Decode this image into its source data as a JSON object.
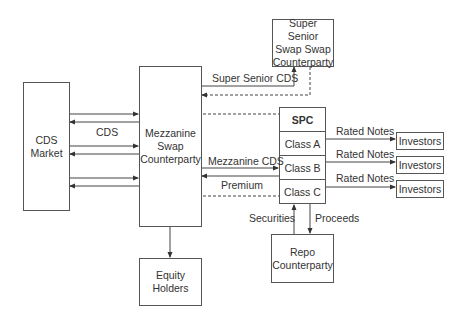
{
  "nodes": {
    "cds_market": "CDS\nMarket",
    "mezzanine": "Mezzanine\nSwap\nCounterparty",
    "super_senior": "Super Senior\nSwap Swap\nCounterparty",
    "equity": "Equity\nHolders",
    "repo": "Repo\nCounterparty",
    "investors": [
      "Investors",
      "Investors",
      "Investors"
    ],
    "spc": {
      "title": "SPC",
      "classes": [
        "Class A",
        "Class B",
        "Class C"
      ]
    }
  },
  "edges": {
    "cds": "CDS",
    "super_senior_cds": "Super Senior CDS",
    "mezzanine_cds": "Mezzanine CDS",
    "premium": "Premium",
    "rated_notes": [
      "Rated Notes",
      "Rated Notes",
      "Rated Notes"
    ],
    "securities": "Securities",
    "proceeds": "Proceeds"
  }
}
